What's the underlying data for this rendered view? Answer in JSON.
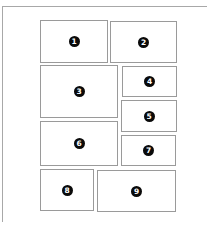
{
  "diagram": {
    "type": "page-layout-wireframe",
    "panels": [
      {
        "label": "1",
        "x": 40,
        "y": 20,
        "w": 68,
        "h": 43
      },
      {
        "label": "2",
        "x": 110,
        "y": 21,
        "w": 67,
        "h": 42
      },
      {
        "label": "3",
        "x": 40,
        "y": 65,
        "w": 78,
        "h": 53
      },
      {
        "label": "4",
        "x": 122,
        "y": 66,
        "w": 55,
        "h": 31
      },
      {
        "label": "5",
        "x": 121,
        "y": 100,
        "w": 56,
        "h": 32
      },
      {
        "label": "6",
        "x": 40,
        "y": 121,
        "w": 78,
        "h": 45
      },
      {
        "label": "7",
        "x": 121,
        "y": 135,
        "w": 55,
        "h": 31
      },
      {
        "label": "8",
        "x": 40,
        "y": 169,
        "w": 54,
        "h": 42
      },
      {
        "label": "9",
        "x": 97,
        "y": 170,
        "w": 79,
        "h": 42
      }
    ],
    "colors": {
      "panel_border": "#9a9a9a",
      "frame_border": "#a8a8a8",
      "badge_fill": "#0a0a0a",
      "badge_text": "#ffffff"
    }
  }
}
